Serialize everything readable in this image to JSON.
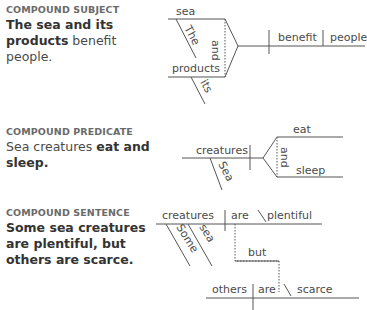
{
  "sections": [
    {
      "heading": "COMPOUND SUBJECT",
      "sentence_parts": [
        {
          "text": "The sea and its products",
          "bold": true
        },
        {
          "text": " benefit people.",
          "bold": false
        }
      ],
      "diagram": {
        "subjects": [
          "sea",
          "products"
        ],
        "modifiers": [
          "The",
          "its"
        ],
        "conjunction": "and",
        "verb": "benefit",
        "object": "people"
      }
    },
    {
      "heading": "COMPOUND PREDICATE",
      "sentence_parts": [
        {
          "text": "Sea creatures ",
          "bold": false
        },
        {
          "text": "eat and sleep.",
          "bold": true
        }
      ],
      "diagram": {
        "subject": "creatures",
        "modifier": "Sea",
        "verbs": [
          "eat",
          "sleep"
        ],
        "conjunction": "and"
      }
    },
    {
      "heading": "COMPOUND SENTENCE",
      "sentence_parts": [
        {
          "text": "Some sea creatures are plentiful, but others are scarce.",
          "bold": true
        }
      ],
      "diagram": {
        "clause1": {
          "subject": "creatures",
          "verb": "are",
          "complement": "plentiful",
          "modifiers": [
            "Some",
            "sea"
          ]
        },
        "conjunction": "but",
        "clause2": {
          "subject": "others",
          "verb": "are",
          "complement": "scarce"
        }
      }
    }
  ]
}
